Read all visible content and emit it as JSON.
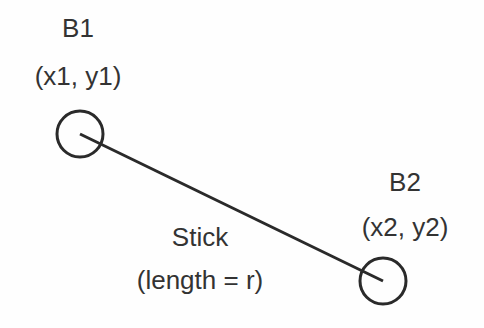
{
  "diagram": {
    "ball1": {
      "name": "B1",
      "coords": "(x1, y1)",
      "cx": 80,
      "cy": 134,
      "r": 23
    },
    "ball2": {
      "name": "B2",
      "coords": "(x2, y2)",
      "cx": 383,
      "cy": 280,
      "r": 23
    },
    "stick": {
      "label": "Stick",
      "sublabel": "(length = r)"
    },
    "stroke_color": "#2a2a2a"
  }
}
